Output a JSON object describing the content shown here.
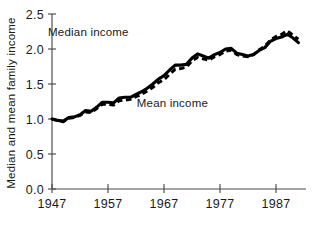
{
  "chart_data": {
    "type": "line",
    "title": "",
    "xlabel": "",
    "ylabel": "Median and mean family income",
    "xlim": [
      1947,
      1992
    ],
    "ylim": [
      0.0,
      2.5
    ],
    "grid": false,
    "legend_position": "inline-annotations",
    "x_tick_labels": [
      "1947",
      "1957",
      "1967",
      "1977",
      "1987"
    ],
    "x_ticks": [
      1947,
      1957,
      1967,
      1977,
      1987
    ],
    "y_tick_labels": [
      "0.0",
      "0.5",
      "1.0",
      "1.5",
      "2.0",
      "2.5"
    ],
    "y_ticks": [
      0.0,
      0.5,
      1.0,
      1.5,
      2.0,
      2.5
    ],
    "annotations": [
      {
        "text": "Median income",
        "x": 1953.5,
        "y": 2.18
      },
      {
        "text": "Mean income",
        "x": 1968.5,
        "y": 1.17
      }
    ],
    "x": [
      1947,
      1948,
      1949,
      1950,
      1951,
      1952,
      1953,
      1954,
      1955,
      1956,
      1957,
      1958,
      1959,
      1960,
      1961,
      1962,
      1963,
      1964,
      1965,
      1966,
      1967,
      1968,
      1969,
      1970,
      1971,
      1972,
      1973,
      1974,
      1975,
      1976,
      1977,
      1978,
      1979,
      1980,
      1981,
      1982,
      1983,
      1984,
      1985,
      1986,
      1987,
      1988,
      1989,
      1990,
      1991
    ],
    "series": [
      {
        "name": "Median income",
        "style": "solid",
        "values": [
          1.0,
          0.98,
          0.97,
          1.02,
          1.03,
          1.06,
          1.12,
          1.11,
          1.17,
          1.24,
          1.24,
          1.23,
          1.3,
          1.31,
          1.31,
          1.35,
          1.39,
          1.44,
          1.5,
          1.57,
          1.62,
          1.7,
          1.77,
          1.77,
          1.78,
          1.87,
          1.93,
          1.9,
          1.87,
          1.92,
          1.95,
          2.0,
          2.01,
          1.94,
          1.92,
          1.9,
          1.92,
          1.98,
          2.02,
          2.11,
          2.15,
          2.17,
          2.21,
          2.16,
          2.09
        ]
      },
      {
        "name": "Mean income",
        "style": "dashed",
        "values": [
          1.0,
          0.98,
          0.96,
          1.01,
          1.02,
          1.05,
          1.1,
          1.09,
          1.15,
          1.21,
          1.21,
          1.2,
          1.26,
          1.27,
          1.28,
          1.32,
          1.35,
          1.4,
          1.45,
          1.52,
          1.56,
          1.64,
          1.71,
          1.72,
          1.74,
          1.83,
          1.88,
          1.86,
          1.84,
          1.89,
          1.92,
          1.97,
          1.98,
          1.92,
          1.9,
          1.89,
          1.92,
          1.99,
          2.04,
          2.13,
          2.18,
          2.21,
          2.26,
          2.2,
          2.14
        ]
      }
    ]
  },
  "colors": {
    "ink": "#000000",
    "axis": "#4a4a4a",
    "background": "#ffffff"
  }
}
